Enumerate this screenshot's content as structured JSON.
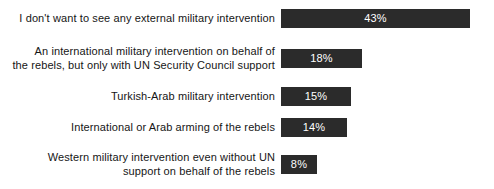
{
  "chart_data": {
    "type": "bar",
    "orientation": "horizontal",
    "title": "",
    "subtitle": "",
    "xlabel": "",
    "ylabel": "",
    "grid": false,
    "legend": null,
    "axis_visible": false,
    "value_suffix": "%",
    "xlim": [
      0,
      43
    ],
    "bar_color": "#2b2b2b",
    "value_label_color": "#ffffff",
    "background_color": "#ffffff",
    "categories": [
      "I don't want to see any external military intervention",
      "An international military intervention on behalf of\nthe rebels, but only with UN Security Council support",
      "Turkish-Arab military intervention",
      "International or Arab arming of the rebels",
      "Western military intervention even without UN\nsupport on behalf of the rebels"
    ],
    "values": [
      43,
      18,
      15,
      14,
      8
    ],
    "value_labels": [
      "43%",
      "18%",
      "15%",
      "14%",
      "8%"
    ]
  },
  "rows": [
    {
      "label": "I don't want to see any external military intervention",
      "value_label": "43%",
      "bar_px": 189,
      "top_px": 9
    },
    {
      "label": "An international military intervention on behalf of\nthe rebels, but only with UN Security Council support",
      "value_label": "18%",
      "bar_px": 81,
      "top_px": 49
    },
    {
      "label": "Turkish-Arab military intervention",
      "value_label": "15%",
      "bar_px": 70,
      "top_px": 87
    },
    {
      "label": "International or Arab arming of the rebels",
      "value_label": "14%",
      "bar_px": 66,
      "top_px": 118
    },
    {
      "label": "Western military intervention even without UN\nsupport on behalf of the rebels",
      "value_label": "8%",
      "bar_px": 36,
      "top_px": 155
    }
  ]
}
